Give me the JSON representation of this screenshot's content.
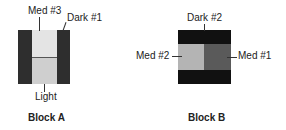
{
  "blocks": [
    {
      "caption": "Block A",
      "labels": {
        "top_left": "Med #3",
        "top_right": "Dark #1",
        "bottom": "Light"
      },
      "pieces": [
        {
          "name": "dark-1-left",
          "color": "#2e2e2e"
        },
        {
          "name": "med-3",
          "color": "#e4e4e4"
        },
        {
          "name": "light",
          "color": "#cfcfcf"
        },
        {
          "name": "dark-1-right",
          "color": "#2e2e2e"
        }
      ]
    },
    {
      "caption": "Block B",
      "labels": {
        "top": "Dark #2",
        "left": "Med #2",
        "right": "Med #1"
      },
      "pieces": [
        {
          "name": "dark-2-top",
          "color": "#111111"
        },
        {
          "name": "med-2",
          "color": "#b4b4b4"
        },
        {
          "name": "med-1",
          "color": "#5a5a5a"
        },
        {
          "name": "dark-2-bottom",
          "color": "#111111"
        }
      ]
    }
  ]
}
